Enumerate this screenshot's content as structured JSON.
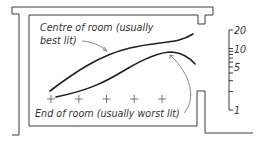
{
  "diagram": {
    "type": "room-section-daylight-factor",
    "labels": {
      "centre": "Centre of room (usually",
      "centre_line2": "best lit)",
      "end": "End of room (usually worst lit)"
    },
    "scale": {
      "type": "log",
      "min": 1,
      "max": 20,
      "tick_values": [
        1,
        2,
        3,
        4,
        5,
        6,
        7,
        8,
        9,
        10,
        20
      ],
      "tick_labels": [
        {
          "value": 20,
          "text": "20"
        },
        {
          "value": 10,
          "text": "10"
        },
        {
          "value": 5,
          "text": "5"
        },
        {
          "value": 1,
          "text": "1"
        }
      ]
    },
    "measurement_points": 5,
    "curves": [
      {
        "name": "centre-of-room",
        "description": "Centre of room (usually best lit)"
      },
      {
        "name": "end-of-room",
        "description": "End of room (usually worst lit)"
      }
    ],
    "colors": {
      "ink": "#1e1e1e",
      "background": "#ffffff"
    }
  }
}
